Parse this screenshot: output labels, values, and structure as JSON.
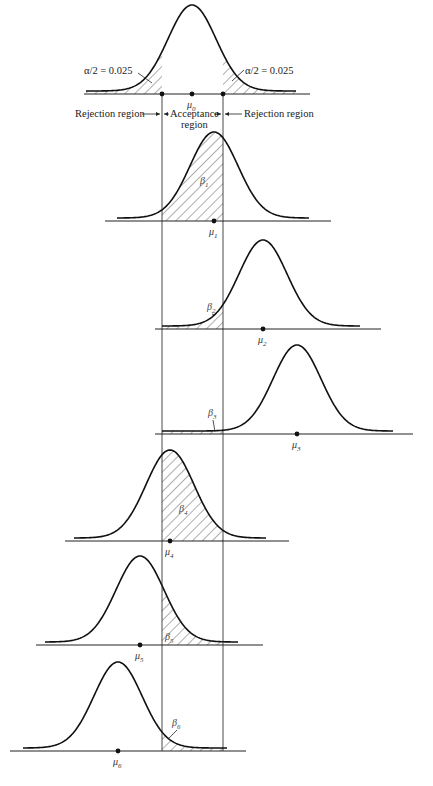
{
  "critical_lines": {
    "left_x": 162,
    "right_x": 223,
    "top_y": 94,
    "bottom_y": 751
  },
  "null_panel": {
    "mean_label": "μ",
    "mean_sub": "0",
    "alpha_left_label": "α/2 = 0.025",
    "alpha_right_label": "α/2 = 0.025",
    "rejection_left_label": "Rejection region",
    "acceptance_label_line1": "Acceptance",
    "acceptance_label_line2": "region",
    "rejection_right_label": "Rejection region",
    "curve": {
      "mu_x": 192,
      "base_y": 94,
      "height": 86,
      "sigma": 24,
      "curve_from": 86,
      "curve_to": 296,
      "axis_from": 84,
      "axis_to": 310
    }
  },
  "alt_panels": [
    {
      "id": 1,
      "mean_sub": "1",
      "beta_label": "β",
      "beta_sub": "1",
      "curve": {
        "mu_x": 214,
        "base_y": 221,
        "height": 86,
        "sigma": 24,
        "curve_from": 117,
        "curve_to": 309,
        "axis_from": 105,
        "axis_to": 331
      },
      "beta_label_pos": [
        200,
        184
      ]
    },
    {
      "id": 2,
      "mean_sub": "2",
      "beta_label": "β",
      "beta_sub": "2",
      "curve": {
        "mu_x": 263,
        "base_y": 329,
        "height": 86,
        "sigma": 24,
        "curve_from": 162,
        "curve_to": 360,
        "axis_from": 155,
        "axis_to": 381
      },
      "beta_label_pos": [
        207,
        310
      ]
    },
    {
      "id": 3,
      "mean_sub": "3",
      "beta_label": "β",
      "beta_sub": "3",
      "curve": {
        "mu_x": 297,
        "base_y": 434,
        "height": 86,
        "sigma": 24,
        "curve_from": 162,
        "curve_to": 393,
        "axis_from": 155,
        "axis_to": 413
      },
      "beta_label_pos": [
        208,
        416
      ]
    },
    {
      "id": 4,
      "mean_sub": "4",
      "beta_label": "β",
      "beta_sub": "4",
      "curve": {
        "mu_x": 170,
        "base_y": 541,
        "height": 88,
        "sigma": 24,
        "curve_from": 74,
        "curve_to": 266,
        "axis_from": 65,
        "axis_to": 289
      },
      "beta_label_pos": [
        179,
        512
      ]
    },
    {
      "id": 5,
      "mean_sub": "5",
      "beta_label": "β",
      "beta_sub": "5",
      "curve": {
        "mu_x": 140,
        "base_y": 645,
        "height": 86,
        "sigma": 24,
        "curve_from": 45,
        "curve_to": 238,
        "axis_from": 36,
        "axis_to": 263
      },
      "beta_label_pos": [
        165,
        640
      ]
    },
    {
      "id": 6,
      "mean_sub": "6",
      "beta_label": "β",
      "beta_sub": "6",
      "curve": {
        "mu_x": 118,
        "base_y": 751,
        "height": 86,
        "sigma": 24,
        "curve_from": 23,
        "curve_to": 227,
        "axis_from": 10,
        "axis_to": 246
      },
      "beta_label_pos": [
        172,
        726
      ]
    }
  ]
}
